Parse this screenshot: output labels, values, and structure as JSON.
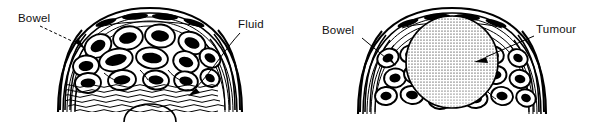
{
  "figure": {
    "style": "black ink line drawing on white background",
    "background_color": "#ffffff",
    "ink_color": "#000000",
    "panel_count": 2
  },
  "panels": [
    {
      "id": "ascites",
      "position": "left",
      "description": "Transverse section of abdomen distended by free fluid (ascites), bowel loops floating anteriorly",
      "labels": [
        {
          "name": "bowel",
          "text": "Bowel",
          "align": "left",
          "pointer": "dashed-line",
          "points_to": "bowel-loop-left-lateral"
        },
        {
          "name": "fluid",
          "text": "Fluid",
          "align": "right",
          "pointer": "solid-arrow",
          "points_to": "fluid-wavy-region"
        }
      ],
      "structures": [
        "abdominal-wall-arc",
        "rectus-muscle-segments",
        "bowel-loops",
        "fluid-wavy-lines",
        "pelvic-dome-arc"
      ],
      "bowel_loop_count": 14,
      "wave_line_count": 8
    },
    {
      "id": "tumour",
      "position": "right",
      "description": "Transverse section of abdomen distended by a large solid ovarian tumour displacing bowel loops peripherally",
      "labels": [
        {
          "name": "bowel",
          "text": "Bowel",
          "align": "left",
          "pointer": "solid-arrow",
          "points_to": "bowel-loop-left-lateral"
        },
        {
          "name": "tumour",
          "text": "Tumour",
          "align": "right",
          "pointer": "solid-arrow",
          "points_to": "tumour-mass-centre"
        }
      ],
      "structures": [
        "abdominal-wall-arc",
        "rectus-muscle-segments",
        "tumour-mass",
        "bowel-loops"
      ],
      "bowel_loop_count": 14,
      "tumour_texture": "stippled"
    }
  ]
}
